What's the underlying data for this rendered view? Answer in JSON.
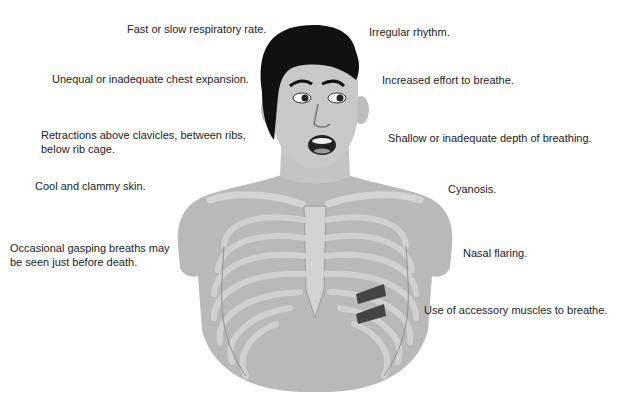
{
  "diagram": {
    "labels_left": [
      {
        "text": "Fast or slow respiratory rate.",
        "x": 127,
        "y": 22
      },
      {
        "text": "Unequal or inadequate chest expansion.",
        "x": 52,
        "y": 72
      },
      {
        "text": "Retractions above clavicles, between ribs,",
        "x": 41,
        "y": 128
      },
      {
        "text": "below rib cage.",
        "x": 41,
        "y": 142
      },
      {
        "text": "Cool and clammy skin.",
        "x": 35,
        "y": 179
      },
      {
        "text": "Occasional gasping breaths may",
        "x": 10,
        "y": 241
      },
      {
        "text": "be seen just before death.",
        "x": 10,
        "y": 255
      }
    ],
    "labels_right": [
      {
        "text": "Irregular rhythm.",
        "x": 369,
        "y": 25
      },
      {
        "text": "Increased effort to breathe.",
        "x": 382,
        "y": 73
      },
      {
        "text": "Shallow or inadequate depth of breathing.",
        "x": 388,
        "y": 131
      },
      {
        "text": "Cyanosis.",
        "x": 448,
        "y": 182
      },
      {
        "text": "Nasal flaring.",
        "x": 463,
        "y": 246
      },
      {
        "text": "Use of accessory muscles to breathe.",
        "x": 424,
        "y": 303
      }
    ]
  }
}
